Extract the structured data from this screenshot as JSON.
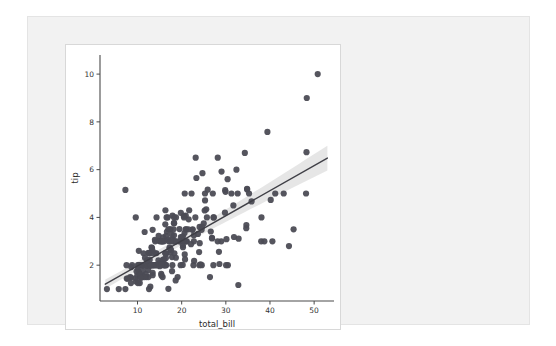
{
  "figure": {
    "background_color": "#ffffff",
    "panel_color": "#f2f2f2",
    "panel_border_color": "#e4e4e4",
    "card_border_color": "#d8d8d8"
  },
  "chart_data": {
    "type": "scatter",
    "title": "",
    "xlabel": "total_bill",
    "ylabel": "tip",
    "xlim": [
      1.5,
      54.5
    ],
    "ylim": [
      0.5,
      10.8
    ],
    "xticks": [
      10,
      20,
      30,
      40,
      50
    ],
    "yticks": [
      2,
      4,
      6,
      8,
      10
    ],
    "xticklabels": [
      "10",
      "20",
      "30",
      "40",
      "50"
    ],
    "yticklabels": [
      "2",
      "4",
      "6",
      "8",
      "10"
    ],
    "grid": false,
    "legend": null,
    "marker_color": "#4c4c55",
    "marker_size": 3.1,
    "marker_opacity": 0.95,
    "line_color": "#3f3f46",
    "line_width": 1.4,
    "ci_band_color": "#c8c8c8",
    "ci_band_opacity": 0.45,
    "regression": {
      "slope": 0.105,
      "intercept": 0.92,
      "ci_halfwidth_at_xmin": 0.14,
      "ci_halfwidth_at_xmax": 0.42
    },
    "series": [
      {
        "name": "tips",
        "x": [
          16.99,
          10.34,
          21.01,
          23.68,
          24.59,
          25.29,
          8.77,
          26.88,
          15.04,
          14.78,
          10.27,
          35.26,
          15.42,
          18.43,
          14.83,
          21.58,
          10.33,
          16.29,
          16.97,
          20.65,
          17.92,
          20.29,
          15.77,
          39.42,
          19.82,
          17.81,
          13.37,
          12.69,
          21.7,
          19.65,
          9.55,
          18.35,
          15.06,
          20.69,
          17.78,
          24.06,
          16.31,
          16.93,
          18.69,
          31.27,
          16.04,
          17.46,
          13.94,
          9.68,
          30.4,
          18.29,
          22.23,
          32.4,
          28.55,
          18.04,
          12.54,
          10.29,
          34.81,
          9.94,
          25.56,
          19.49,
          38.01,
          26.41,
          11.24,
          48.27,
          20.29,
          13.81,
          11.02,
          18.29,
          17.59,
          20.08,
          16.45,
          3.07,
          20.23,
          15.01,
          12.02,
          17.07,
          26.86,
          25.28,
          14.73,
          10.51,
          17.92,
          27.2,
          22.76,
          17.29,
          19.44,
          16.66,
          10.07,
          32.68,
          15.98,
          34.83,
          13.03,
          18.28,
          24.71,
          21.16,
          28.97,
          22.49,
          5.75,
          16.32,
          22.75,
          40.17,
          27.28,
          12.03,
          21.01,
          12.46,
          11.35,
          15.38,
          44.3,
          22.42,
          20.92,
          15.36,
          20.49,
          25.21,
          18.24,
          14.31,
          14.0,
          7.25,
          38.07,
          23.95,
          25.71,
          17.31,
          29.93,
          10.65,
          12.43,
          24.08,
          11.69,
          13.42,
          14.26,
          15.95,
          12.48,
          29.8,
          8.52,
          14.52,
          11.38,
          22.82,
          19.08,
          20.27,
          11.17,
          12.26,
          18.26,
          8.51,
          10.33,
          14.15,
          16.0,
          13.16,
          17.47,
          34.3,
          41.19,
          27.05,
          16.43,
          8.35,
          18.64,
          11.87,
          9.78,
          7.51,
          14.07,
          13.13,
          17.26,
          24.55,
          19.77,
          29.85,
          48.17,
          25.0,
          13.39,
          16.49,
          21.5,
          12.66,
          16.21,
          13.81,
          17.51,
          24.52,
          20.76,
          31.71,
          10.59,
          10.63,
          50.81,
          15.81,
          7.25,
          31.85,
          16.82,
          32.9,
          17.89,
          14.48,
          9.6,
          34.63,
          34.65,
          23.33,
          45.35,
          23.17,
          40.55,
          20.69,
          20.9,
          30.46,
          18.15,
          23.1,
          15.69,
          19.81,
          28.44,
          15.48,
          16.58,
          7.56,
          10.34,
          43.11,
          13.0,
          13.51,
          18.71,
          12.74,
          13.0,
          16.4,
          20.53,
          16.47,
          26.59,
          38.73,
          24.27,
          12.76,
          30.06,
          25.89,
          48.33,
          13.27,
          28.17,
          12.9,
          28.15,
          11.59,
          7.74,
          30.14,
          12.16,
          13.42,
          8.58,
          15.98,
          13.42,
          16.27,
          10.09,
          20.45,
          13.28,
          22.12,
          24.01,
          15.69,
          11.61,
          10.77,
          15.53,
          10.07,
          12.6,
          32.83,
          35.83,
          29.03,
          27.18,
          22.67,
          17.82,
          18.78
        ],
        "y": [
          1.01,
          1.66,
          3.5,
          3.31,
          3.61,
          4.71,
          2.0,
          3.12,
          1.96,
          3.23,
          1.71,
          5.0,
          1.57,
          3.0,
          3.02,
          3.92,
          1.67,
          3.71,
          3.5,
          3.35,
          4.08,
          2.75,
          2.23,
          7.58,
          3.18,
          2.34,
          2.0,
          2.0,
          4.3,
          3.0,
          1.45,
          2.5,
          3.0,
          2.45,
          3.27,
          3.6,
          2.0,
          3.07,
          2.31,
          5.0,
          2.24,
          2.54,
          3.06,
          1.32,
          5.6,
          3.0,
          5.0,
          6.0,
          2.05,
          3.0,
          2.5,
          2.6,
          5.2,
          1.56,
          4.34,
          3.51,
          3.0,
          1.5,
          1.76,
          6.73,
          3.21,
          2.0,
          1.98,
          3.76,
          2.64,
          3.15,
          2.47,
          1.0,
          2.01,
          2.09,
          1.97,
          3.0,
          3.14,
          5.0,
          2.2,
          1.25,
          3.08,
          4.0,
          3.0,
          2.71,
          3.0,
          3.4,
          1.83,
          5.0,
          2.03,
          5.17,
          2.0,
          4.0,
          5.85,
          3.0,
          3.0,
          3.5,
          1.0,
          4.3,
          3.25,
          4.73,
          4.0,
          1.5,
          3.0,
          1.5,
          2.5,
          3.0,
          2.8,
          3.48,
          4.08,
          1.64,
          4.06,
          4.29,
          3.76,
          4.0,
          3.0,
          1.0,
          4.0,
          2.55,
          4.0,
          3.5,
          5.07,
          1.5,
          1.8,
          2.92,
          2.31,
          1.68,
          2.5,
          2.0,
          2.52,
          4.2,
          1.48,
          2.0,
          2.0,
          2.18,
          1.5,
          2.83,
          1.5,
          2.0,
          3.25,
          1.25,
          2.0,
          2.0,
          2.0,
          2.75,
          3.5,
          6.7,
          5.0,
          5.0,
          2.3,
          1.5,
          1.36,
          1.63,
          1.73,
          2.0,
          2.5,
          2.0,
          2.74,
          2.0,
          2.0,
          5.14,
          5.0,
          3.75,
          2.61,
          2.0,
          3.5,
          2.5,
          2.0,
          2.0,
          3.0,
          3.48,
          2.24,
          4.5,
          1.61,
          2.0,
          10.0,
          3.16,
          5.15,
          3.18,
          4.0,
          3.11,
          2.0,
          2.0,
          4.0,
          3.55,
          3.68,
          5.65,
          3.5,
          6.5,
          3.0,
          5.0,
          3.5,
          2.0,
          3.5,
          4.0,
          1.5,
          4.19,
          2.56,
          2.02,
          4.0,
          1.44,
          2.0,
          5.0,
          2.0,
          2.0,
          4.0,
          2.0,
          2.0,
          2.5,
          4.0,
          3.23,
          3.41,
          3.0,
          2.03,
          2.23,
          2.0,
          5.16,
          9.0,
          2.5,
          6.5,
          1.1,
          3.0,
          1.5,
          1.44,
          3.09,
          2.2,
          3.48,
          1.92,
          3.0,
          1.58,
          2.5,
          2.0,
          3.0,
          2.72,
          2.88,
          2.0,
          3.0,
          3.39,
          1.47,
          3.0,
          1.25,
          1.0,
          1.17,
          4.67,
          5.92,
          2.0,
          2.0,
          1.75,
          3.0
        ]
      }
    ]
  }
}
